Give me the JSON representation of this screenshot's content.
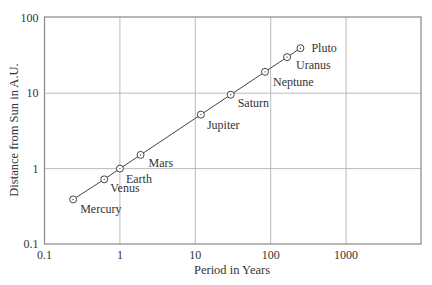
{
  "chart_data": {
    "type": "scatter",
    "title": "",
    "xlabel": "Period in Years",
    "ylabel": "Distance from Sun in A.U.",
    "xscale": "log",
    "yscale": "log",
    "xlim": [
      0.1,
      10000
    ],
    "ylim": [
      0.1,
      100
    ],
    "xticks": [
      "0.1",
      "1",
      "10",
      "100",
      "1000"
    ],
    "yticks": [
      "0.1",
      "1",
      "10",
      "100"
    ],
    "grid": true,
    "series": [
      {
        "name": "Planets",
        "points": [
          {
            "label": "Mercury",
            "x": 0.24,
            "y": 0.39
          },
          {
            "label": "Venus",
            "x": 0.62,
            "y": 0.72
          },
          {
            "label": "Earth",
            "x": 1.0,
            "y": 1.0
          },
          {
            "label": "Mars",
            "x": 1.88,
            "y": 1.52
          },
          {
            "label": "Jupiter",
            "x": 11.86,
            "y": 5.2
          },
          {
            "label": "Saturn",
            "x": 29.46,
            "y": 9.54
          },
          {
            "label": "Neptune",
            "x": 84,
            "y": 19.2
          },
          {
            "label": "Uranus",
            "x": 165,
            "y": 30.1
          },
          {
            "label": "Pluto",
            "x": 248,
            "y": 39.5
          }
        ]
      }
    ]
  }
}
